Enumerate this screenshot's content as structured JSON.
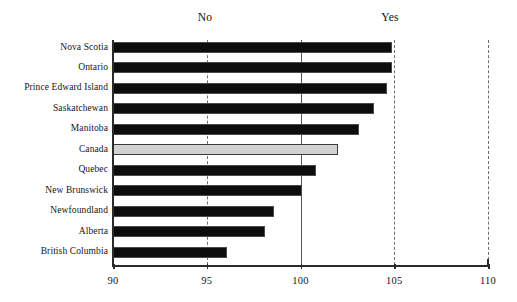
{
  "chart_data": {
    "type": "bar",
    "orientation": "horizontal",
    "title": "",
    "subtitle": "",
    "xlabel": "",
    "ylabel": "",
    "xlim": [
      90,
      110
    ],
    "ylim": null,
    "grid": true,
    "grid_axis": "x",
    "legend": null,
    "legend_position": "none",
    "reference_line": 100,
    "categories": [
      "Nova Scotia",
      "Ontario",
      "Prince Edward Island",
      "Saskatchewan",
      "Manitoba",
      "Canada",
      "Quebec",
      "New Brunswick",
      "Newfoundland",
      "Alberta",
      "British Columbia"
    ],
    "values": [
      104.9,
      104.9,
      104.6,
      103.9,
      103.1,
      102.0,
      100.8,
      100.1,
      98.6,
      98.1,
      96.1
    ],
    "highlight_category": "Canada",
    "xticks": [
      90,
      95,
      100,
      105,
      110
    ],
    "xtick_labels": [
      "90",
      "95",
      "100",
      "105",
      "110"
    ],
    "annotations": [
      {
        "name": "no-annotation",
        "text": "No",
        "x": 205,
        "align": "left-side"
      },
      {
        "name": "yes-annotation",
        "text": "Yes",
        "x": 390,
        "align": "right-side"
      }
    ],
    "colors": {
      "bar": "#0d0d0d",
      "bar_highlight": "#d2d2d2",
      "bar_highlight_border": "#3a3a3a",
      "axis": "#2b2b2b",
      "gridline": "#6e6e6e",
      "reference_line": "#555555",
      "text": "#151515",
      "background": "#ffffff"
    }
  }
}
